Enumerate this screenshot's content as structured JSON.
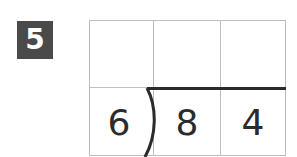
{
  "problem": {
    "number": "5",
    "divisor": "6",
    "dividend_digits": [
      "8",
      "4"
    ],
    "quotient_digits": [
      "",
      "",
      ""
    ]
  }
}
